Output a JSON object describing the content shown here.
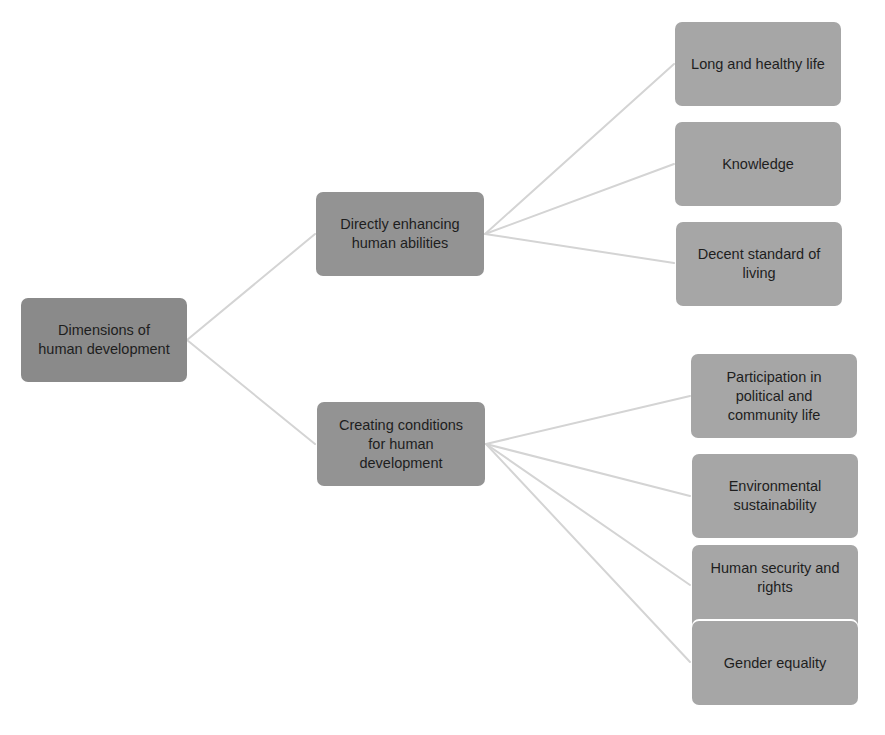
{
  "diagram": {
    "title": "Dimensions of human development",
    "colors": {
      "root": "#8a8a8a",
      "mid": "#939393",
      "leaf": "#a6a6a6",
      "connector": "#d4d4d4",
      "text": "#1e1e1e"
    },
    "root": {
      "label": "Dimensions of\nhuman development"
    },
    "branches": [
      {
        "label": "Directly enhancing\nhuman abilities",
        "children": [
          {
            "label": "Long and healthy life"
          },
          {
            "label": "Knowledge"
          },
          {
            "label": "Decent standard of\nliving"
          }
        ]
      },
      {
        "label": "Creating conditions\nfor human\ndevelopment",
        "children": [
          {
            "label": "Participation in\npolitical and\ncommunity life"
          },
          {
            "label": "Environmental\nsustainability"
          },
          {
            "label": "Human security and\nrights"
          },
          {
            "label": "Gender equality"
          }
        ]
      }
    ]
  }
}
